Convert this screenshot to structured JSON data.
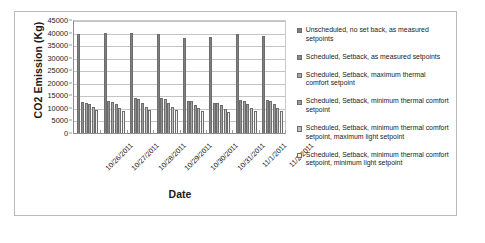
{
  "chart_data": {
    "type": "bar",
    "title": "",
    "xlabel": "Date",
    "ylabel": "CO2 Emission (Kg)",
    "ylim": [
      0,
      45000
    ],
    "yticks": [
      45000,
      40000,
      35000,
      30000,
      25000,
      20000,
      15000,
      10000,
      5000,
      0
    ],
    "grid": true,
    "legend_position": "right",
    "categories": [
      "10/26/2011",
      "10/27/2011",
      "10/28/2011",
      "10/29/2011",
      "10/30/2011",
      "10/31/2011",
      "11/1/2011",
      "11/2/2011"
    ],
    "series": [
      {
        "name": "Unscheduled, no set back, as measured setpoints",
        "color": "#7f7f7f",
        "values": [
          39800,
          40100,
          40200,
          39900,
          38100,
          38600,
          39800,
          38900
        ]
      },
      {
        "name": "Scheduled, Setback, as measured setpoints",
        "color": "#8c8c8c",
        "values": [
          12600,
          13000,
          14200,
          14200,
          13300,
          12500,
          13400,
          13500
        ]
      },
      {
        "name": "Scheduled, Setback, maximum thermal comfort setpoint",
        "color": "#a6a6a6",
        "values": [
          12500,
          12900,
          14000,
          13900,
          13300,
          12500,
          13200,
          13200
        ]
      },
      {
        "name": "Scheduled, Setback, minimum thermal comfort setpoint",
        "color": "#9c9c9c",
        "values": [
          11900,
          11900,
          12500,
          12400,
          11600,
          11500,
          11800,
          11900
        ]
      },
      {
        "name": "Scheduled, Setback, minimum thermal comfort setpoint, maximum light setpoint",
        "color": "#bfbfbf",
        "values": [
          10600,
          10400,
          10900,
          10800,
          10200,
          10000,
          10300,
          10400
        ]
      },
      {
        "name": "Scheduled, Setback, minimum thermal comfort setpoint, minimum light setpoint",
        "color": "#f2f2f2",
        "values": [
          9400,
          9200,
          9700,
          9600,
          9100,
          8900,
          9200,
          9200
        ]
      }
    ]
  },
  "legend": {
    "items": [
      "Unscheduled, no set back, as measured setpoints",
      "Scheduled, Setback, as measured setpoints",
      "Scheduled, Setback, maximum thermal comfort setpoint",
      "Scheduled, Setback, minimum thermal comfort setpoint",
      "Scheduled, Setback, minimum thermal comfort setpoint, maximum light setpoint",
      "Scheduled, Setback, minimum thermal comfort setpoint, minimum light setpoint"
    ]
  }
}
